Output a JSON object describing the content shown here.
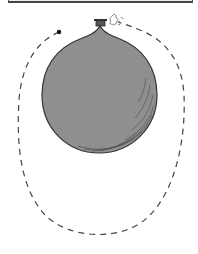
{
  "figure": {
    "elements": {
      "balloon": {
        "fill": "#8f8f8f",
        "stroke": "#333333"
      },
      "valve": {
        "fill": "#555555"
      },
      "air_puffs": {
        "stroke": "#666666"
      },
      "flight_path": {
        "style": "dashed",
        "stroke": "#444444",
        "start_marker": "dot"
      }
    }
  }
}
